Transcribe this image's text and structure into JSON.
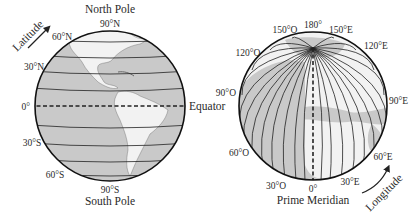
{
  "left_globe": {
    "title_top": "North Pole",
    "title_bottom": "South Pole",
    "arrow_label": "Latitude",
    "equator_label": "Equator",
    "latitudes": {
      "n90": "90°N",
      "n60": "60°N",
      "n30": "30°N",
      "zero": "0°",
      "s30": "30°S",
      "s60": "60°S",
      "s90": "90°S"
    }
  },
  "right_globe": {
    "title_bottom": "Prime Meridian",
    "arrow_label": "Longitude",
    "longitudes": {
      "l180": "180°",
      "w150": "150°O",
      "e150": "150°E",
      "w120": "120°O",
      "e120": "120°E",
      "w90": "90°O",
      "e90": "90°E",
      "w60": "60°O",
      "e60": "60°E",
      "w30": "30°O",
      "e30": "30°E",
      "zero": "0°"
    }
  },
  "colors": {
    "ocean": "#c9c9c9",
    "land": "#f2f2f2",
    "line": "#222222"
  }
}
